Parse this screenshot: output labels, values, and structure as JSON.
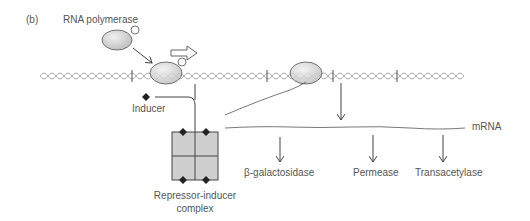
{
  "panel_label": "(b)",
  "labels": {
    "rna_polymerase": "RNA polymerase",
    "inducer": "Inducer",
    "mrna": "mRNA",
    "repressor_inducer_line1": "Repressor-inducer",
    "repressor_inducer_line2": "complex"
  },
  "proteins": [
    {
      "label": "β-galactosidase"
    },
    {
      "label": "Permease"
    },
    {
      "label": "Transacetylase"
    }
  ],
  "colors": {
    "stroke": "#444444",
    "fill_ellipse": "#d4d4d4",
    "fill_repressor": "#cfcfcf",
    "dna": "#9a9a9a",
    "inducer": "#222222"
  }
}
